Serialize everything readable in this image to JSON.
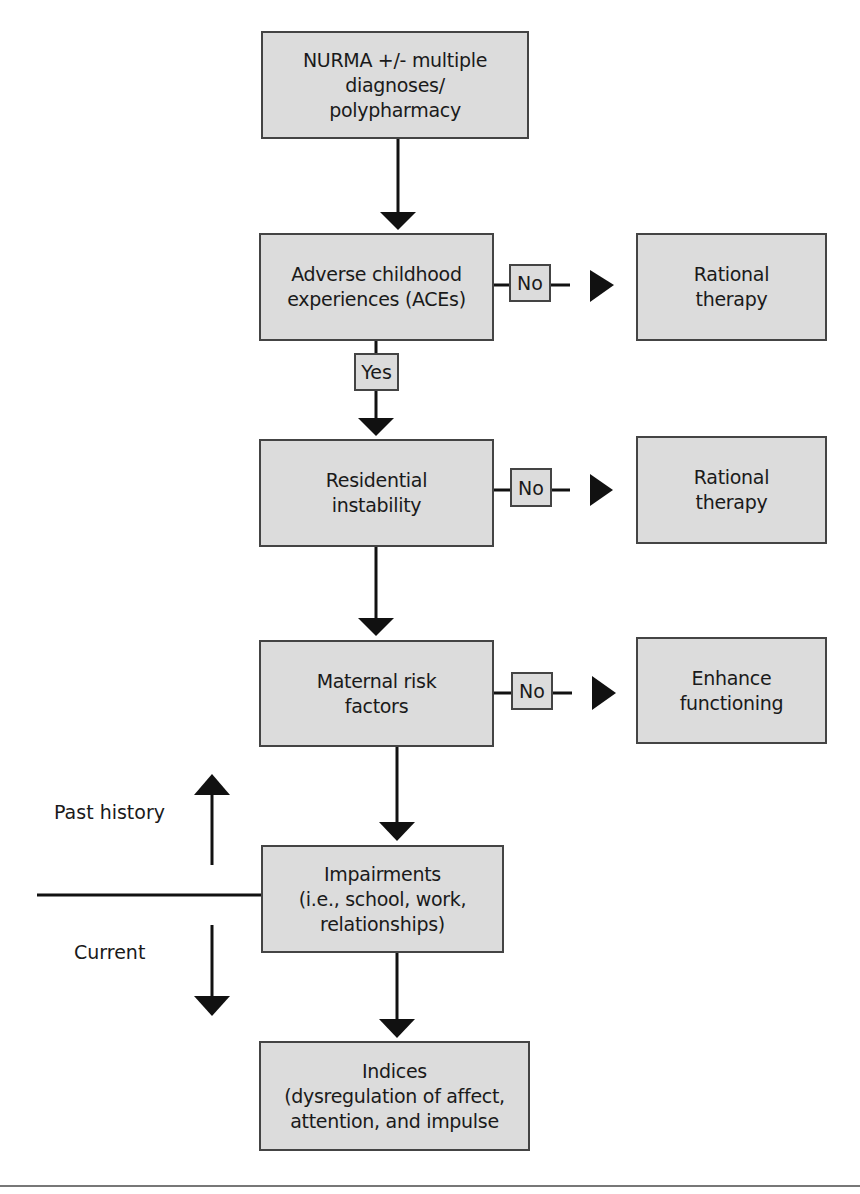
{
  "diagram": {
    "nodes": {
      "start": {
        "text": "NURMA +/- multiple\ndiagnoses/\npolypharmacy"
      },
      "aces": {
        "text": "Adverse childhood\nexperiences (ACEs)"
      },
      "rational1": {
        "text": "Rational\ntherapy"
      },
      "residential": {
        "text": "Residential\ninstability"
      },
      "rational2": {
        "text": "Rational\ntherapy"
      },
      "maternal": {
        "text": "Maternal risk\nfactors"
      },
      "enhance": {
        "text": "Enhance\nfunctioning"
      },
      "impairments": {
        "text": "Impairments\n(i.e., school, work,\nrelationships)"
      },
      "indices": {
        "text": "Indices\n(dysregulation of affect,\nattention, and impulse"
      }
    },
    "edge_labels": {
      "aces_no": "No",
      "aces_yes": "Yes",
      "residential_no": "No",
      "maternal_no": "No"
    },
    "timeline": {
      "past": "Past history",
      "current": "Current"
    },
    "colors": {
      "box_fill": "#dcdcdc",
      "box_border": "#444444",
      "line": "#111111"
    }
  }
}
